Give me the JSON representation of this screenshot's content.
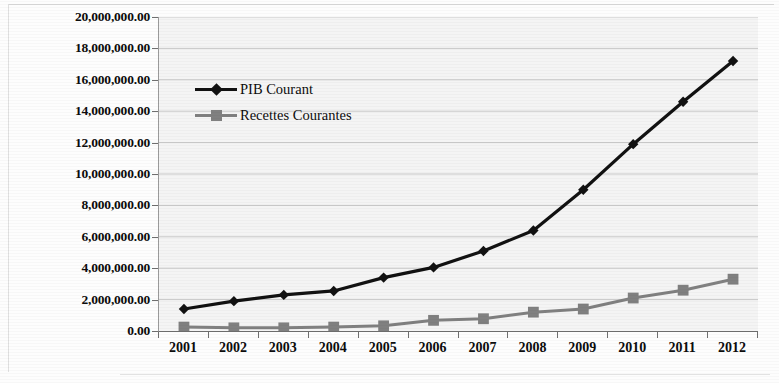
{
  "chart_data": {
    "type": "line",
    "title": "",
    "xlabel": "",
    "ylabel": "",
    "categories": [
      "2001",
      "2002",
      "2003",
      "2004",
      "2005",
      "2006",
      "2007",
      "2008",
      "2009",
      "2010",
      "2011",
      "2012"
    ],
    "series": [
      {
        "name": "PIB Courant",
        "color": "#111111",
        "marker": "diamond",
        "values": [
          1400000,
          1900000,
          2300000,
          2550000,
          3400000,
          4050000,
          5100000,
          6400000,
          9000000,
          11900000,
          14600000,
          17200000
        ]
      },
      {
        "name": "Recettes Courantes",
        "color": "#808080",
        "marker": "square",
        "values": [
          250000,
          200000,
          200000,
          250000,
          330000,
          680000,
          780000,
          1200000,
          1400000,
          2100000,
          2600000,
          3300000
        ]
      }
    ],
    "ylim": [
      0,
      20000000
    ],
    "ytick_values": [
      0,
      2000000,
      4000000,
      6000000,
      8000000,
      10000000,
      12000000,
      14000000,
      16000000,
      18000000,
      20000000
    ],
    "ytick_labels": [
      "0.00",
      "2,000,000.00",
      "4,000,000.00",
      "6,000,000.00",
      "8,000,000.00",
      "10,000,000.00",
      "12,000,000.00",
      "14,000,000.00",
      "16,000,000.00",
      "18,000,000.00",
      "20,000,000.00"
    ],
    "grid": true,
    "grid_color": "#c8c8c8",
    "plot_background": "#f4f4f4",
    "legend_position": "inside-top-left",
    "legend": [
      "PIB Courant",
      "Recettes Courantes"
    ]
  }
}
